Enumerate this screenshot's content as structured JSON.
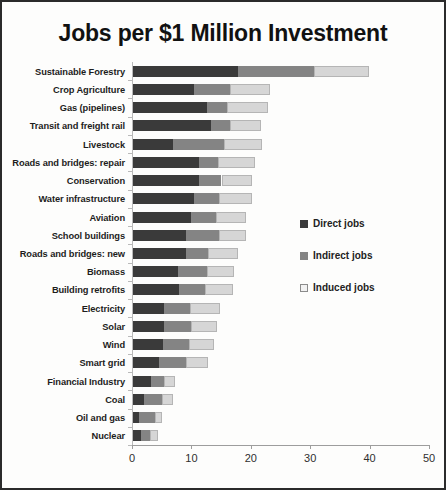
{
  "chart_data": {
    "type": "bar",
    "orientation": "horizontal",
    "stacked": true,
    "title": "Jobs per $1 Million Investment",
    "xlabel": "",
    "ylabel": "",
    "xlim": [
      0,
      50
    ],
    "xticks": [
      0,
      10,
      20,
      30,
      40,
      50
    ],
    "xtick_labels": [
      "0",
      "10",
      "20",
      "30",
      "40",
      "50"
    ],
    "grid": false,
    "legend_position": "right-middle",
    "categories": [
      "Sustainable Forestry",
      "Crop Agriculture",
      "Gas (pipelines)",
      "Transit and freight rail",
      "Livestock",
      "Roads and bridges: repair",
      "Conservation",
      "Water infrastructure",
      "Aviation",
      "School buildings",
      "Roads and bridges: new",
      "Biomass",
      "Building retrofits",
      "Electricity",
      "Solar",
      "Wind",
      "Smart grid",
      "Financial Industry",
      "Coal",
      "Oil and gas",
      "Nuclear"
    ],
    "series": [
      {
        "name": "Direct jobs",
        "color": "#3a3a3a",
        "values": [
          17.6,
          10.2,
          12.4,
          13.1,
          6.7,
          11.1,
          11.1,
          10.2,
          9.7,
          8.9,
          8.9,
          7.5,
          7.7,
          5.2,
          5.2,
          5.0,
          4.4,
          3.0,
          1.8,
          1.0,
          1.3
        ]
      },
      {
        "name": "Indirect jobs",
        "color": "#848484",
        "values": [
          12.8,
          6.1,
          3.4,
          3.2,
          8.7,
          3.2,
          3.8,
          4.2,
          4.2,
          5.5,
          3.7,
          4.9,
          4.5,
          4.4,
          4.5,
          4.4,
          4.5,
          2.2,
          3.1,
          2.7,
          1.6
        ]
      },
      {
        "name": "Induced jobs",
        "color": "#d6d6d6",
        "values": [
          9.4,
          6.7,
          7.0,
          5.3,
          6.4,
          6.3,
          5.2,
          5.6,
          5.2,
          4.7,
          5.0,
          4.6,
          4.6,
          5.0,
          4.4,
          4.2,
          3.8,
          1.8,
          1.9,
          1.1,
          1.3
        ]
      }
    ],
    "totals": [
      39.8,
      23.0,
      22.8,
      21.6,
      21.8,
      20.6,
      20.1,
      20.0,
      19.1,
      19.1,
      17.6,
      17.0,
      16.8,
      14.6,
      14.1,
      13.6,
      12.7,
      7.0,
      6.8,
      4.8,
      4.2
    ]
  }
}
